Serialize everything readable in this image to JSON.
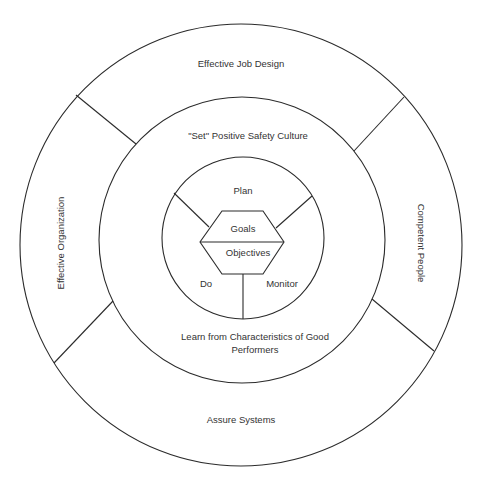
{
  "diagram": {
    "type": "concentric-circle-model",
    "colors": {
      "line": "#2b2b2b",
      "text": "#333333",
      "background": "#ffffff"
    },
    "outer_ring": {
      "segments": [
        {
          "label": "Effective Job Design",
          "position": "top"
        },
        {
          "label": "Competent People",
          "position": "right"
        },
        {
          "label": "Assure Systems",
          "position": "bottom"
        },
        {
          "label": "Effective Organization",
          "position": "left"
        }
      ]
    },
    "middle_ring": {
      "segments": [
        {
          "label": "\"Set\" Positive Safety Culture",
          "position": "top"
        },
        {
          "label_line1": "Learn from Characteristics of Good",
          "label_line2": "Performers",
          "position": "bottom"
        }
      ]
    },
    "inner_circle": {
      "segments": [
        {
          "label": "Plan",
          "position": "top"
        },
        {
          "label": "Do",
          "position": "bottom-left"
        },
        {
          "label": "Monitor",
          "position": "bottom-right"
        }
      ]
    },
    "center_hexagon": {
      "top_label": "Goals",
      "bottom_label": "Objectives"
    }
  }
}
